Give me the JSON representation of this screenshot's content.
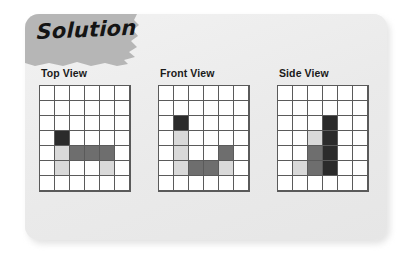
{
  "card": {
    "title": "Solution",
    "tab_color": "#b6b6b6",
    "background_color": "#ededed"
  },
  "palette": {
    "empty": "#ffffff",
    "light": "#d9d9d9",
    "medium": "#6e6e6e",
    "dark": "#2b2b2b",
    "gridline": "#5a5a5a"
  },
  "chart_data": {
    "type": "heatmap",
    "title": "Solution",
    "grid_cols": 6,
    "grid_rows": 7,
    "legend": {
      "e": "empty",
      "l": "light-gray",
      "m": "medium-gray",
      "d": "dark"
    },
    "panels": [
      {
        "label": "Top View",
        "cells": [
          [
            "e",
            "e",
            "e",
            "e",
            "e",
            "e"
          ],
          [
            "e",
            "e",
            "e",
            "e",
            "e",
            "e"
          ],
          [
            "e",
            "e",
            "e",
            "e",
            "e",
            "e"
          ],
          [
            "e",
            "d",
            "e",
            "e",
            "e",
            "e"
          ],
          [
            "e",
            "l",
            "m",
            "m",
            "m",
            "e"
          ],
          [
            "e",
            "l",
            "e",
            "e",
            "l",
            "e"
          ],
          [
            "e",
            "e",
            "e",
            "e",
            "e",
            "e"
          ]
        ]
      },
      {
        "label": "Front View",
        "cells": [
          [
            "e",
            "e",
            "e",
            "e",
            "e",
            "e"
          ],
          [
            "e",
            "e",
            "e",
            "e",
            "e",
            "e"
          ],
          [
            "e",
            "d",
            "e",
            "e",
            "e",
            "e"
          ],
          [
            "e",
            "l",
            "e",
            "e",
            "e",
            "e"
          ],
          [
            "e",
            "l",
            "e",
            "e",
            "m",
            "e"
          ],
          [
            "e",
            "l",
            "m",
            "m",
            "l",
            "e"
          ],
          [
            "e",
            "e",
            "e",
            "e",
            "e",
            "e"
          ]
        ]
      },
      {
        "label": "Side View",
        "cells": [
          [
            "e",
            "e",
            "e",
            "e",
            "e",
            "e"
          ],
          [
            "e",
            "e",
            "e",
            "e",
            "e",
            "e"
          ],
          [
            "e",
            "e",
            "e",
            "d",
            "e",
            "e"
          ],
          [
            "e",
            "e",
            "l",
            "d",
            "e",
            "e"
          ],
          [
            "e",
            "e",
            "m",
            "d",
            "e",
            "e"
          ],
          [
            "e",
            "l",
            "m",
            "d",
            "e",
            "e"
          ],
          [
            "e",
            "e",
            "e",
            "e",
            "e",
            "e"
          ]
        ]
      }
    ]
  }
}
